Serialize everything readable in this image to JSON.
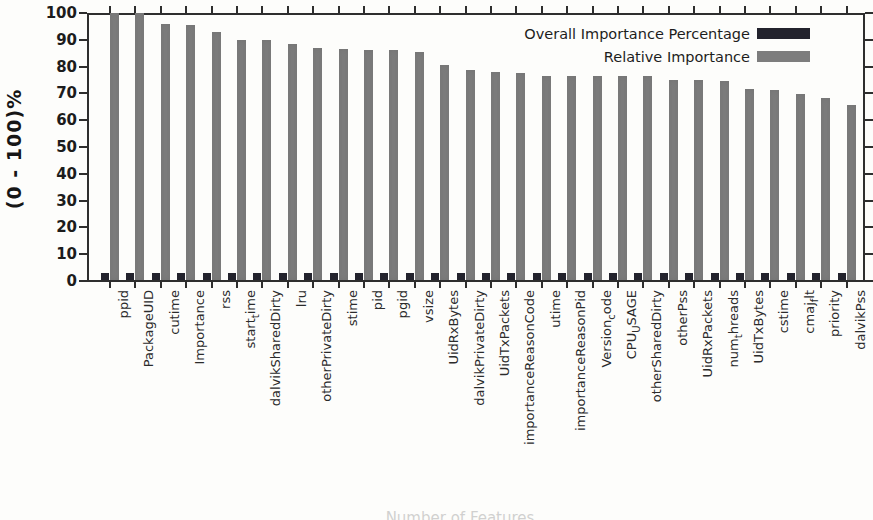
{
  "figure": {
    "ylabel": "(0 - 100)%",
    "bottom_caption": "Number of Features"
  },
  "chart_data": {
    "type": "bar",
    "title": "",
    "xlabel": "",
    "ylabel": "(0 - 100)%",
    "ylim": [
      0,
      100
    ],
    "y_tick_step": 10,
    "grid": false,
    "legend_position": "top-right-inside",
    "bar_color_overall": "#23232d",
    "bar_color_relative": "#7d7d7d",
    "categories": [
      "ppid",
      "PackageUID",
      "cutime",
      "Importance",
      "rss",
      "start_time",
      "dalvikSharedDirty",
      "lru",
      "otherPrivateDirty",
      "stime",
      "pid",
      "pgid",
      "vsize",
      "UidRxBytes",
      "dalvikPrivateDirty",
      "UidTxPackets",
      "importanceReasonCode",
      "utime",
      "importanceReasonPid",
      "Version_code",
      "CPU_USAGE",
      "otherSharedDirty",
      "otherPss",
      "UidRxPackets",
      "num_threads",
      "UidTxBytes",
      "cstime",
      "cmaj_flt",
      "priority",
      "dalvikPss"
    ],
    "categories_display": [
      {
        "pre": "ppid",
        "sub": "",
        "post": ""
      },
      {
        "pre": "PackageUID",
        "sub": "",
        "post": ""
      },
      {
        "pre": "cutime",
        "sub": "",
        "post": ""
      },
      {
        "pre": "Importance",
        "sub": "",
        "post": ""
      },
      {
        "pre": "rss",
        "sub": "",
        "post": ""
      },
      {
        "pre": "start",
        "sub": "t",
        "post": "ime"
      },
      {
        "pre": "dalvikSharedDirty",
        "sub": "",
        "post": ""
      },
      {
        "pre": "lru",
        "sub": "",
        "post": ""
      },
      {
        "pre": "otherPrivateDirty",
        "sub": "",
        "post": ""
      },
      {
        "pre": "stime",
        "sub": "",
        "post": ""
      },
      {
        "pre": "pid",
        "sub": "",
        "post": ""
      },
      {
        "pre": "pgid",
        "sub": "",
        "post": ""
      },
      {
        "pre": "vsize",
        "sub": "",
        "post": ""
      },
      {
        "pre": "UidRxBytes",
        "sub": "",
        "post": ""
      },
      {
        "pre": "dalvikPrivateDirty",
        "sub": "",
        "post": ""
      },
      {
        "pre": "UidTxPackets",
        "sub": "",
        "post": ""
      },
      {
        "pre": "importanceReasonCode",
        "sub": "",
        "post": ""
      },
      {
        "pre": "utime",
        "sub": "",
        "post": ""
      },
      {
        "pre": "importanceReasonPid",
        "sub": "",
        "post": ""
      },
      {
        "pre": "Version",
        "sub": "c",
        "post": "ode"
      },
      {
        "pre": "CPU",
        "sub": "U",
        "post": "SAGE"
      },
      {
        "pre": "otherSharedDirty",
        "sub": "",
        "post": ""
      },
      {
        "pre": "otherPss",
        "sub": "",
        "post": ""
      },
      {
        "pre": "UidRxPackets",
        "sub": "",
        "post": ""
      },
      {
        "pre": "num",
        "sub": "t",
        "post": "hreads"
      },
      {
        "pre": "UidTxBytes",
        "sub": "",
        "post": ""
      },
      {
        "pre": "cstime",
        "sub": "",
        "post": ""
      },
      {
        "pre": "cmaj",
        "sub": "f",
        "post": "lt"
      },
      {
        "pre": "priority",
        "sub": "",
        "post": ""
      },
      {
        "pre": "dalvikPss",
        "sub": "",
        "post": ""
      }
    ],
    "series": [
      {
        "name": "Overall Importance Percentage",
        "color": "#23232d",
        "values": [
          2.5,
          2.5,
          2.5,
          2.5,
          2.5,
          2.5,
          2.5,
          2.5,
          2.5,
          2.5,
          2.5,
          2.5,
          2.5,
          2.5,
          2.5,
          2.5,
          2.5,
          2.5,
          2.5,
          2.5,
          2.5,
          2.5,
          2.5,
          2.5,
          2.5,
          2.5,
          2.5,
          2.5,
          2.5,
          2.5
        ]
      },
      {
        "name": "Relative Importance",
        "color": "#7d7d7d",
        "values": [
          100,
          100,
          96,
          95.5,
          93,
          90,
          90,
          88.5,
          87,
          86.5,
          86,
          86,
          85.5,
          80.5,
          78.5,
          78,
          77.5,
          76.5,
          76.5,
          76.5,
          76.5,
          76.5,
          75,
          75,
          74.5,
          71.5,
          71,
          69.5,
          68,
          65.5
        ]
      }
    ]
  }
}
